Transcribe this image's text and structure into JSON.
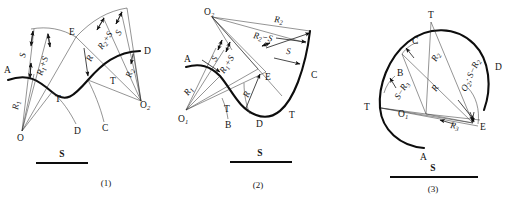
{
  "figure": {
    "title": "",
    "panels": [
      {
        "id": "panel-1",
        "caption": "(1)",
        "scale_label": "S",
        "points": [
          {
            "name": "A",
            "label": "A"
          },
          {
            "name": "D-upper",
            "label": "D"
          },
          {
            "name": "D-lower",
            "label": "D"
          },
          {
            "name": "C",
            "label": "C"
          },
          {
            "name": "E",
            "label": "E"
          },
          {
            "name": "T-left",
            "label": "T"
          },
          {
            "name": "T-right",
            "label": "T"
          },
          {
            "name": "O",
            "label": "O"
          },
          {
            "name": "O2",
            "label": "O",
            "sub": "2"
          }
        ],
        "dimensions": [
          {
            "name": "S-left",
            "label": "S"
          },
          {
            "name": "R1-plus-S",
            "label": "R",
            "sub": "1",
            "tail": "+S"
          },
          {
            "name": "R1",
            "label": "R",
            "sub": "1"
          },
          {
            "name": "R-center",
            "label": "R"
          },
          {
            "name": "R2-plus-S",
            "label": "R",
            "sub": "2",
            "tail": "+S"
          },
          {
            "name": "S-right",
            "label": "S"
          },
          {
            "name": "R2",
            "label": "R",
            "sub": "2"
          }
        ]
      },
      {
        "id": "panel-2",
        "caption": "(2)",
        "scale_label": "S",
        "points": [
          {
            "name": "A",
            "label": "A"
          },
          {
            "name": "B",
            "label": "B"
          },
          {
            "name": "C",
            "label": "C"
          },
          {
            "name": "D",
            "label": "D"
          },
          {
            "name": "E",
            "label": "E"
          },
          {
            "name": "T-left",
            "label": "T"
          },
          {
            "name": "T-right",
            "label": "T"
          },
          {
            "name": "O1",
            "label": "O",
            "sub": "1"
          },
          {
            "name": "O2",
            "label": "O",
            "sub": "2"
          }
        ],
        "dimensions": [
          {
            "name": "R2",
            "label": "R",
            "sub": "2"
          },
          {
            "name": "R2-minus-S",
            "label": "R",
            "sub": "2",
            "tail": "−S"
          },
          {
            "name": "S-right",
            "label": "S"
          },
          {
            "name": "S-left",
            "label": "S"
          },
          {
            "name": "R1-plus-S",
            "label": "R",
            "sub": "1",
            "tail": "+S"
          },
          {
            "name": "R1",
            "label": "R",
            "sub": "1"
          },
          {
            "name": "R-center",
            "label": "R"
          }
        ]
      },
      {
        "id": "panel-3",
        "caption": "(3)",
        "scale_label": "S",
        "points": [
          {
            "name": "A",
            "label": "A"
          },
          {
            "name": "B",
            "label": "B"
          },
          {
            "name": "C",
            "label": "C"
          },
          {
            "name": "D",
            "label": "D"
          },
          {
            "name": "E",
            "label": "E"
          },
          {
            "name": "T-top",
            "label": "T"
          },
          {
            "name": "T-left",
            "label": "T"
          },
          {
            "name": "O1",
            "label": "O",
            "sub": "1"
          }
        ],
        "dimensions": [
          {
            "name": "R2",
            "label": "R",
            "sub": "2"
          },
          {
            "name": "R-center",
            "label": "R"
          },
          {
            "name": "O2-S-minus-R2",
            "label": "O",
            "sub": "2",
            "tail": "; S−R",
            "tail_sub": "2"
          },
          {
            "name": "S-minus-R3",
            "label": "S−R",
            "sub": "3"
          },
          {
            "name": "R3",
            "label": "R",
            "sub": "3"
          }
        ]
      }
    ]
  }
}
